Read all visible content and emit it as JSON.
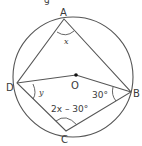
{
  "diagram": {
    "type": "cyclic-quadrilateral",
    "points": {
      "A": {
        "label": "A",
        "x": 64,
        "y": 19
      },
      "B": {
        "label": "B",
        "x": 131,
        "y": 92
      },
      "C": {
        "label": "C",
        "x": 66,
        "y": 131
      },
      "D": {
        "label": "D",
        "x": 17,
        "y": 83
      },
      "O": {
        "label": "O",
        "x": 76,
        "y": 75
      }
    },
    "circle": {
      "cx": 73,
      "cy": 77,
      "r": 60
    },
    "angles": {
      "A": "x",
      "D": "y",
      "B": "30°",
      "C": "2x – 30°"
    },
    "stroke_color": "#555555",
    "top_fragment": "g"
  }
}
